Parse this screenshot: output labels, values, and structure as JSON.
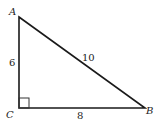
{
  "diagram": {
    "type": "right-triangle",
    "vertices": {
      "A": {
        "label": "A"
      },
      "B": {
        "label": "B"
      },
      "C": {
        "label": "C"
      }
    },
    "sides": {
      "AC": {
        "label": "6"
      },
      "AB": {
        "label": "10"
      },
      "CB": {
        "label": "8"
      }
    },
    "right_angle_at": "C",
    "colors": {
      "line": "#1a1a1a",
      "text": "#222222",
      "background": "#ffffff"
    }
  }
}
